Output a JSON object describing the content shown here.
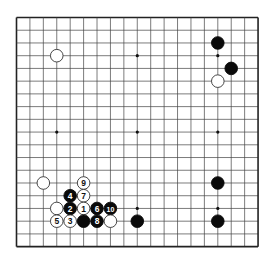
{
  "board": {
    "size": 19,
    "origin_x": 16.5,
    "origin_y": 17.5,
    "spacing_x": 13.42,
    "spacing_y": 12.73,
    "stone_radius": 6.3,
    "line_color": "#444444",
    "border_color": "#222222",
    "background": "#ffffff",
    "black_color": "#0a0a0a",
    "white_fill": "#ffffff",
    "white_stroke": "#333333",
    "star_points": [
      [
        3,
        3
      ],
      [
        9,
        3
      ],
      [
        15,
        3
      ],
      [
        3,
        9
      ],
      [
        9,
        9
      ],
      [
        15,
        9
      ],
      [
        3,
        15
      ],
      [
        9,
        15
      ],
      [
        15,
        15
      ]
    ]
  },
  "stones": [
    {
      "color": "white",
      "col": 3,
      "row": 3,
      "label": ""
    },
    {
      "color": "black",
      "col": 15,
      "row": 2,
      "label": ""
    },
    {
      "color": "black",
      "col": 16,
      "row": 4,
      "label": ""
    },
    {
      "color": "white",
      "col": 15,
      "row": 5,
      "label": ""
    },
    {
      "color": "black",
      "col": 15,
      "row": 13,
      "label": ""
    },
    {
      "color": "black",
      "col": 15,
      "row": 16,
      "label": ""
    },
    {
      "color": "black",
      "col": 9,
      "row": 16,
      "label": ""
    },
    {
      "color": "white",
      "col": 2,
      "row": 13,
      "label": ""
    },
    {
      "color": "white",
      "col": 5,
      "row": 13,
      "label": "9"
    },
    {
      "color": "black",
      "col": 4,
      "row": 14,
      "label": "4"
    },
    {
      "color": "white",
      "col": 5,
      "row": 14,
      "label": "7"
    },
    {
      "color": "white",
      "col": 3,
      "row": 15,
      "label": ""
    },
    {
      "color": "black",
      "col": 4,
      "row": 15,
      "label": "2"
    },
    {
      "color": "white",
      "col": 5,
      "row": 15,
      "label": "1"
    },
    {
      "color": "black",
      "col": 6,
      "row": 15,
      "label": "6"
    },
    {
      "color": "black",
      "col": 7,
      "row": 15,
      "label": "10"
    },
    {
      "color": "white",
      "col": 3,
      "row": 16,
      "label": "5"
    },
    {
      "color": "white",
      "col": 4,
      "row": 16,
      "label": "3"
    },
    {
      "color": "black",
      "col": 5,
      "row": 16,
      "label": ""
    },
    {
      "color": "black",
      "col": 6,
      "row": 16,
      "label": "8"
    },
    {
      "color": "white",
      "col": 7,
      "row": 16,
      "label": ""
    }
  ]
}
